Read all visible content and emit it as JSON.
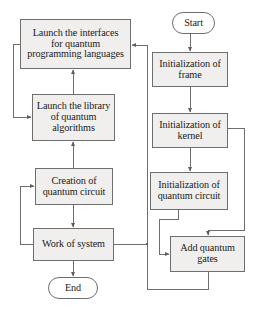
{
  "diagram": {
    "type": "flowchart",
    "style": {
      "box_fill": "#f1efed",
      "terminator_fill": "#ffffff",
      "stroke": "#6e6e6e",
      "text_color": "#1a1a1a",
      "background": "#ffffff"
    },
    "nodes": [
      {
        "id": "launch-interfaces",
        "shape": "process",
        "text": "Launch the interfaces for quantum programming languages",
        "lines": [
          "Launch the interfaces",
          "for quantum",
          "programming languages"
        ],
        "x": 20,
        "y": 19,
        "w": 111,
        "h": 50,
        "font_size": 10.2
      },
      {
        "id": "launch-library",
        "shape": "process",
        "text": "Launch the library of quantum algorithms",
        "lines": [
          "Launch the library",
          "of quantum",
          "algorithms"
        ],
        "x": 32,
        "y": 94,
        "w": 83,
        "h": 47,
        "font_size": 10.2
      },
      {
        "id": "creation-circuit",
        "shape": "process",
        "text": "Creation of quantum circuit",
        "lines": [
          "Creation of",
          "quantum circuit"
        ],
        "x": 35,
        "y": 168,
        "w": 78,
        "h": 37,
        "font_size": 10.2
      },
      {
        "id": "work-of-system",
        "shape": "process",
        "text": "Work of system",
        "lines": [
          "Work of system"
        ],
        "x": 33,
        "y": 228,
        "w": 81,
        "h": 33,
        "font_size": 10.2
      },
      {
        "id": "end",
        "shape": "terminator",
        "text": "End",
        "lines": [
          "End"
        ],
        "x": 48,
        "y": 277,
        "w": 50,
        "h": 22,
        "font_size": 10.2
      },
      {
        "id": "start",
        "shape": "terminator",
        "text": "Start",
        "lines": [
          "Start"
        ],
        "x": 172,
        "y": 12,
        "w": 43,
        "h": 22,
        "font_size": 10.2
      },
      {
        "id": "init-frame",
        "shape": "process",
        "text": "Initialization of frame",
        "lines": [
          "Initialization of",
          "frame"
        ],
        "x": 152,
        "y": 52,
        "w": 76,
        "h": 35,
        "font_size": 10.2
      },
      {
        "id": "init-kernel",
        "shape": "process",
        "text": "Initialization of kernel",
        "lines": [
          "Initialization of",
          "kernel"
        ],
        "x": 152,
        "y": 113,
        "w": 76,
        "h": 35,
        "font_size": 10.2
      },
      {
        "id": "init-quantum-circuit",
        "shape": "process",
        "text": "Initialization of quantum circuit",
        "lines": [
          "Initialization of",
          "quantum circuit"
        ],
        "x": 150,
        "y": 172,
        "w": 78,
        "h": 38,
        "font_size": 10.2
      },
      {
        "id": "add-quantum-gates",
        "shape": "process",
        "text": "Add quantum gates",
        "lines": [
          "Add quantum",
          "gates"
        ],
        "x": 170,
        "y": 236,
        "w": 75,
        "h": 36,
        "font_size": 10.2
      }
    ],
    "edges": [
      {
        "id": "start-to-frame",
        "from": "start",
        "to": "init-frame"
      },
      {
        "id": "frame-to-kernel",
        "from": "init-frame",
        "to": "init-kernel"
      },
      {
        "id": "kernel-to-circuit",
        "from": "init-kernel",
        "to": "init-quantum-circuit"
      },
      {
        "id": "kernel-to-gates",
        "from": "init-kernel",
        "to": "add-quantum-gates"
      },
      {
        "id": "circuit-to-gates",
        "from": "init-quantum-circuit",
        "to": "add-quantum-gates"
      },
      {
        "id": "gates-to-interfaces",
        "from": "add-quantum-gates",
        "to": "launch-interfaces"
      },
      {
        "id": "interfaces-to-library",
        "from": "launch-interfaces",
        "to": "launch-library"
      },
      {
        "id": "library-to-interfaces",
        "from": "launch-library",
        "to": "launch-interfaces"
      },
      {
        "id": "creation-to-library",
        "from": "creation-circuit",
        "to": "launch-library"
      },
      {
        "id": "creation-to-work",
        "from": "creation-circuit",
        "to": "work-of-system"
      },
      {
        "id": "work-to-creation",
        "from": "work-of-system",
        "to": "creation-circuit"
      },
      {
        "id": "work-to-end",
        "from": "work-of-system",
        "to": "end"
      },
      {
        "id": "work-to-right-bus",
        "from": "work-of-system",
        "to": "launch-interfaces"
      }
    ]
  }
}
